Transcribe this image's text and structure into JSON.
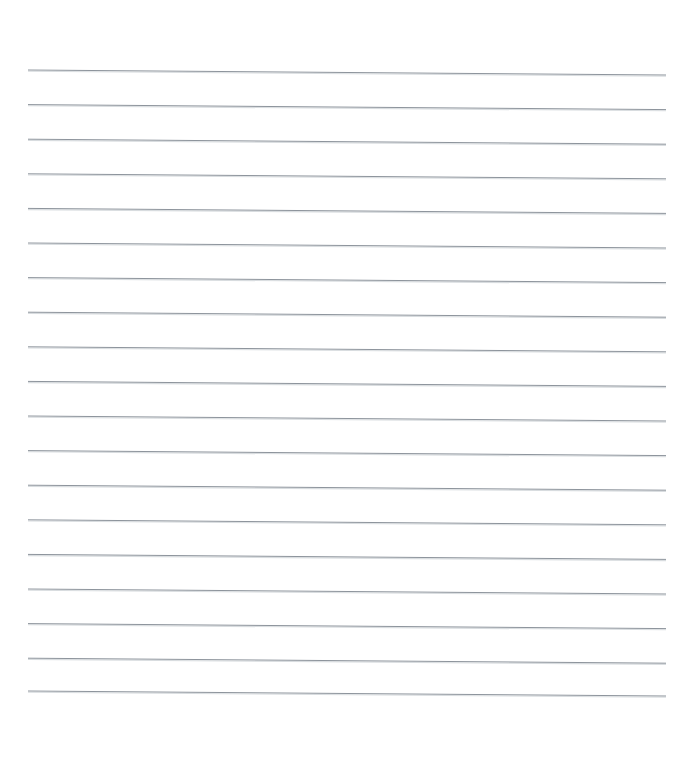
{
  "document": {
    "type": "scanned-lined-paper",
    "title": "Blank Ruled Notebook Page",
    "description": "A scanned blank sheet of ruled (lined) writing paper with no handwriting or printed text.",
    "page_width_px": 685,
    "page_height_px": 761,
    "background_color": "#ffffff",
    "text_content": "",
    "has_margin_rule": false,
    "has_header": false,
    "has_page_number": false
  },
  "ruling": {
    "line_color": "#8d949c",
    "line_shadow_color": "#d8dcdf",
    "line_count": 19,
    "line_thickness_px": 1,
    "left_x_px": 28,
    "right_x_px": 666,
    "first_line_y_px": 70,
    "line_spacing_px": 34.6,
    "slope_drop_px": 5,
    "top_margin_px": 70,
    "bottom_margin_px": 70,
    "lines": [
      {
        "index": 1,
        "y_left": 70.0,
        "y_right": 75.0
      },
      {
        "index": 2,
        "y_left": 104.6,
        "y_right": 109.6
      },
      {
        "index": 3,
        "y_left": 139.2,
        "y_right": 144.2
      },
      {
        "index": 4,
        "y_left": 173.8,
        "y_right": 178.8
      },
      {
        "index": 5,
        "y_left": 208.4,
        "y_right": 213.4
      },
      {
        "index": 6,
        "y_left": 243.0,
        "y_right": 248.0
      },
      {
        "index": 7,
        "y_left": 277.6,
        "y_right": 282.6
      },
      {
        "index": 8,
        "y_left": 312.2,
        "y_right": 317.2
      },
      {
        "index": 9,
        "y_left": 346.8,
        "y_right": 351.8
      },
      {
        "index": 10,
        "y_left": 381.4,
        "y_right": 386.4
      },
      {
        "index": 11,
        "y_left": 416.0,
        "y_right": 421.0
      },
      {
        "index": 12,
        "y_left": 450.6,
        "y_right": 455.6
      },
      {
        "index": 13,
        "y_left": 485.2,
        "y_right": 490.2
      },
      {
        "index": 14,
        "y_left": 519.8,
        "y_right": 524.8
      },
      {
        "index": 15,
        "y_left": 554.4,
        "y_right": 559.4
      },
      {
        "index": 16,
        "y_left": 589.0,
        "y_right": 594.0
      },
      {
        "index": 17,
        "y_left": 623.6,
        "y_right": 628.6
      },
      {
        "index": 18,
        "y_left": 658.2,
        "y_right": 663.2
      },
      {
        "index": 19,
        "y_left": 691.0,
        "y_right": 696.0
      }
    ]
  }
}
